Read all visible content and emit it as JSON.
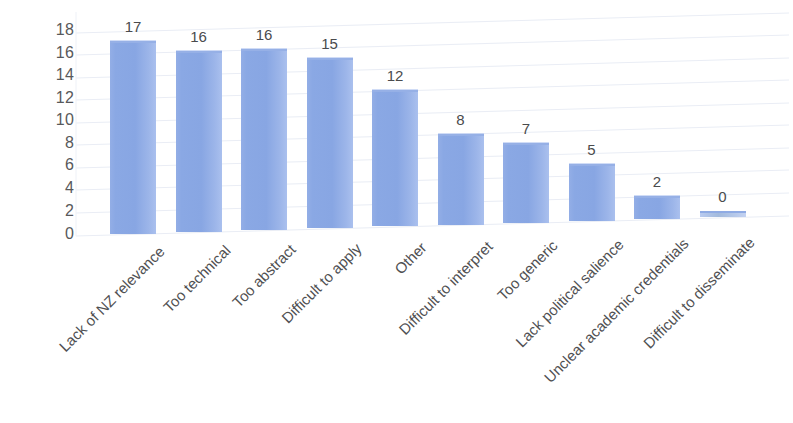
{
  "chart_data": {
    "type": "bar",
    "title": "",
    "subtitle": "",
    "xlabel": "",
    "ylabel": "",
    "ylim": [
      0,
      18
    ],
    "ytick_step": 2,
    "yticks": [
      "18",
      "16",
      "14",
      "12",
      "10",
      "8",
      "6",
      "4",
      "2",
      "0"
    ],
    "grid": true,
    "grid_style": "horizontal-perspective",
    "legend": false,
    "legend_position": "none",
    "orientation": "vertical",
    "style": "3d-perspective",
    "categories": [
      "Lack of NZ relevance",
      "Too technical",
      "Too abstract",
      "Difficult to apply",
      "Other",
      "Difficult to interpret",
      "Too generic",
      "Lack political salience",
      "Unclear academic credentials",
      "Difficult to disseminate"
    ],
    "values": [
      17,
      16,
      16,
      15,
      12,
      8,
      7,
      5,
      2,
      0
    ],
    "value_labels": [
      "17",
      "16",
      "16",
      "15",
      "12",
      "8",
      "7",
      "5",
      "2",
      "0"
    ],
    "series": [
      {
        "name": "",
        "values": [
          17,
          16,
          16,
          15,
          12,
          8,
          7,
          5,
          2,
          0
        ],
        "color": "#8aa8e4"
      }
    ],
    "colors": {
      "bar_fill": "#8aa8e4",
      "bar_highlight": "#aac0ee",
      "bar_top_edge": "#7e9ddb",
      "gridline": "#e8ecf4",
      "axis_text": "#58595b",
      "label_text": "#4f5052",
      "background": "#ffffff"
    }
  }
}
